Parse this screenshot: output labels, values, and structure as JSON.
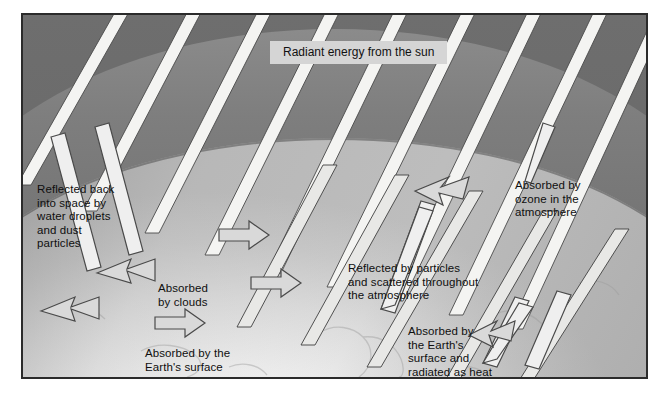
{
  "figure": {
    "title_label": "Radiant energy from the sun",
    "labels": [
      {
        "id": "reflected-space",
        "text": "Reflected back\ninto space by\nwater droplets\nand dust\nparticles"
      },
      {
        "id": "absorbed-clouds",
        "text": "Absorbed\nby clouds"
      },
      {
        "id": "absorbed-surface",
        "text": "Absorbed by the\nEarth's surface"
      },
      {
        "id": "reflected-particles",
        "text": "Reflected by particles\nand scattered throughout\nthe atmosphere"
      },
      {
        "id": "absorbed-ozone",
        "text": "Absorbed by\nozone in the\natmosphere"
      },
      {
        "id": "radiated-heat",
        "text": "Absorbed by\nthe Earth's\nsurface and\nradiated as heat"
      }
    ],
    "colors": {
      "space": "#6e6e6e",
      "ozone_band": "#8b8b8b",
      "earth_light": "#fbfbfb",
      "earth_mid": "#c9c9c9",
      "ray_fill": "#f4f4f2",
      "ray_stroke": "#4a4a4a",
      "title_box": "#d5d5d5",
      "panel_border": "#2b2b2b",
      "text": "#111111",
      "page_background": "#ffffff"
    }
  }
}
